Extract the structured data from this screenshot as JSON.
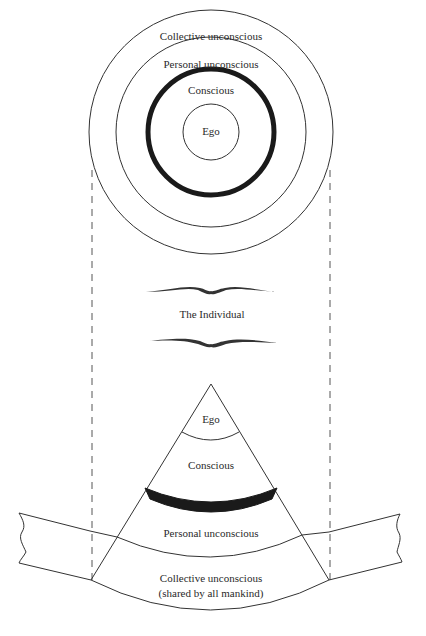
{
  "diagram": {
    "top_view": {
      "rings": [
        {
          "label": "Collective unconscious",
          "radius": 122
        },
        {
          "label": "Personal unconscious",
          "radius": 95
        },
        {
          "label": "Conscious",
          "radius": 65,
          "thick": true
        },
        {
          "label": "Ego",
          "radius": 25
        }
      ]
    },
    "center_title": "The Individual",
    "cross_section": {
      "layers": [
        {
          "label": "Ego"
        },
        {
          "label": "Conscious"
        },
        {
          "label": "Personal unconscious"
        },
        {
          "label": "Collective unconscious",
          "sublabel": "(shared by all mankind)"
        }
      ]
    },
    "colors": {
      "line": "#333333",
      "thick_band": "#1a1a1a",
      "background": "#ffffff"
    }
  }
}
